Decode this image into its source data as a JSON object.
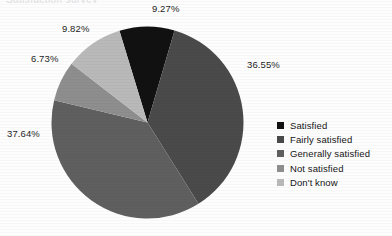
{
  "title_remnant": "Satisfaction survey",
  "chart_data": {
    "type": "pie",
    "title": "",
    "xlabel": "",
    "ylabel": "",
    "legend_position": "right",
    "grid": false,
    "categories": [
      "Satisfied",
      "Fairly satisfied",
      "Generally satisfied",
      "Not satisfied",
      "Don't know"
    ],
    "values": [
      9.27,
      36.55,
      37.64,
      6.73,
      9.82
    ],
    "value_labels": [
      "9.27%",
      "36.55%",
      "37.64%",
      "6.73%",
      "9.82%"
    ],
    "colors": [
      "#111111",
      "#4a4a4a",
      "#5f5f5f",
      "#8e8e8e",
      "#b9b9b9"
    ],
    "start_angle_deg": -17,
    "direction": "clockwise"
  },
  "labels": {
    "satisfied": "9.27%",
    "fairly_satisfied": "36.55%",
    "generally_satisfied": "37.64%",
    "not_satisfied": "6.73%",
    "dont_know": "9.82%"
  },
  "legend": {
    "items": [
      {
        "label": "Satisfied",
        "color": "#111111"
      },
      {
        "label": "Fairly satisfied",
        "color": "#4a4a4a"
      },
      {
        "label": "Generally satisfied",
        "color": "#5f5f5f"
      },
      {
        "label": "Not satisfied",
        "color": "#8e8e8e"
      },
      {
        "label": "Don't know",
        "color": "#b9b9b9"
      }
    ]
  }
}
